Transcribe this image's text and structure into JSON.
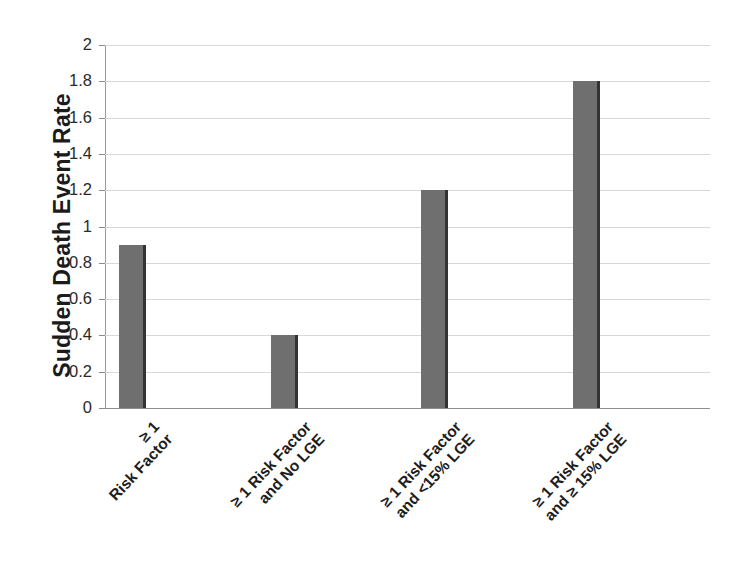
{
  "chart_data": {
    "type": "bar",
    "title": "",
    "subtitle": "",
    "xlabel": "",
    "ylabel": "Sudden Death Event Rate",
    "ylim": [
      0,
      2
    ],
    "ytick_step": 0.2,
    "yticks": [
      "0",
      "0.2",
      "0.4",
      "0.6",
      "0.8",
      "1",
      "1.2",
      "1.4",
      "1.6",
      "1.8",
      "2"
    ],
    "ytick_values": [
      0,
      0.2,
      0.4,
      0.6,
      0.8,
      1,
      1.2,
      1.4,
      1.6,
      1.8,
      2
    ],
    "grid": true,
    "grid_axis": "y",
    "legend": false,
    "legend_position": "none",
    "categories": [
      "≥ 1 Risk Factor",
      "≥ 1 Risk Factor and No LGE",
      "≥ 1 Risk Factor and <15% LGE",
      "≥ 1 Risk Factor and ≥ 15% LGE"
    ],
    "category_lines": [
      [
        "≥ 1",
        "Risk Factor"
      ],
      [
        "≥ 1 Risk Factor",
        "and No LGE"
      ],
      [
        "≥ 1 Risk Factor",
        "and <15% LGE"
      ],
      [
        "≥ 1 Risk Factor",
        "and ≥ 15% LGE"
      ]
    ],
    "values": [
      0.9,
      0.4,
      1.2,
      1.8
    ],
    "series": [
      {
        "name": "Sudden Death Event Rate",
        "values": [
          0.9,
          0.4,
          1.2,
          1.8
        ]
      }
    ],
    "bar_color": "#6f6f6f",
    "bar_edge_color": "#33332f",
    "gridline_color": "#d8d8d8",
    "axis_color": "#9a9a9a",
    "background_color": "#ffffff",
    "text_color": "#1d1d1d"
  }
}
